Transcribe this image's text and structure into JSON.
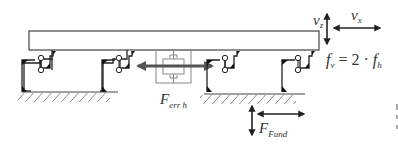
{
  "diagram": {
    "title": "",
    "colors": {
      "line": "#333333",
      "hatch": "#8a8a8a",
      "actuator_arrow": "#555555",
      "actuator_box": "#888888",
      "background": "#ffffff"
    },
    "labels": {
      "vz": {
        "main": "v",
        "sub": "z"
      },
      "vx": {
        "main": "v",
        "sub": "x"
      },
      "freq": {
        "f1": "f",
        "sub1": "v",
        "eq": " = 2 · ",
        "f2": "f",
        "sub2": "h"
      },
      "ferr": {
        "main": "F",
        "sub": "err h"
      },
      "ffund": {
        "main": "F",
        "sub": "Fund"
      }
    },
    "components": [
      {
        "name": "beam",
        "type": "rectangle"
      },
      {
        "name": "support-frame-left",
        "type": "frame"
      },
      {
        "name": "support-frame-right",
        "type": "frame"
      },
      {
        "name": "actuator",
        "type": "damper-box"
      },
      {
        "name": "ground-hatching-left",
        "type": "ground"
      },
      {
        "name": "ground-hatching-right",
        "type": "ground"
      },
      {
        "name": "arrow-vz",
        "type": "double-arrow-vertical"
      },
      {
        "name": "arrow-vx",
        "type": "double-arrow-horizontal"
      },
      {
        "name": "arrow-ferr",
        "type": "double-arrow-horizontal-thick"
      },
      {
        "name": "arrow-ffund-vertical",
        "type": "double-arrow-vertical"
      },
      {
        "name": "arrow-ffund-horizontal",
        "type": "double-arrow-horizontal"
      }
    ]
  }
}
